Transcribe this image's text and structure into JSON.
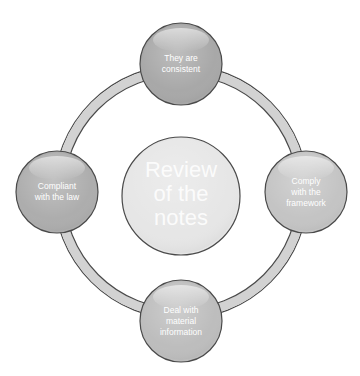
{
  "diagram": {
    "type": "cycle",
    "center": {
      "label_lines": [
        "Review",
        "of the",
        "notes"
      ]
    },
    "nodes": [
      {
        "id": "top",
        "label_lines": [
          "They are",
          "consistent"
        ],
        "fill": "#a8a8a8"
      },
      {
        "id": "right",
        "label_lines": [
          "Comply",
          "with the",
          "framework"
        ],
        "fill": "#c4c4c4"
      },
      {
        "id": "bottom",
        "label_lines": [
          "Deal with",
          "material",
          "information"
        ],
        "fill": "#bdbdbd"
      },
      {
        "id": "left",
        "label_lines": [
          "Compliant",
          "with the law"
        ],
        "fill": "#adadad"
      }
    ],
    "colors": {
      "ring_fill": "#d2d2d2",
      "outline": "#4a4a4a",
      "center_fill": "#e6e6e6",
      "background": "#ffffff"
    }
  }
}
